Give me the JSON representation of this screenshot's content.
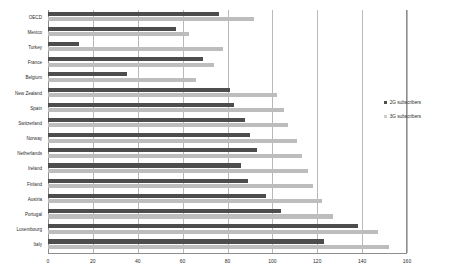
{
  "chart_data": {
    "type": "bar",
    "orientation": "horizontal",
    "title": "",
    "xlabel": "",
    "ylabel": "",
    "xlim": [
      0,
      160
    ],
    "xticks": [
      0,
      20,
      40,
      60,
      80,
      100,
      120,
      140,
      160
    ],
    "grid": true,
    "legend_position": "right",
    "categories": [
      "OECD",
      "Mexico",
      "Turkey",
      "France",
      "Belgium",
      "New Zealand",
      "Spain",
      "Switzerland",
      "Norway",
      "Netherlands",
      "Ireland",
      "Finland",
      "Austria",
      "Portugal",
      "Luxembourg",
      "Italy"
    ],
    "series": [
      {
        "name": "2G subscribers",
        "color": "#4d4d4d",
        "values": [
          76,
          57,
          14,
          69,
          35,
          81,
          83,
          88,
          90,
          93,
          86,
          89,
          97,
          104,
          138,
          123
        ]
      },
      {
        "name": "3G subscribers",
        "color": "#bdbdbd",
        "values": [
          92,
          63,
          78,
          74,
          66,
          102,
          105,
          107,
          111,
          113,
          116,
          118,
          122,
          127,
          147,
          152
        ]
      }
    ]
  },
  "legend": {
    "items": [
      {
        "label": "2G subscribers",
        "swatch": "legend-swatch-2g"
      },
      {
        "label": "3G subscribers",
        "swatch": "legend-swatch-3g"
      }
    ]
  },
  "axis": {
    "tick_labels": [
      "0",
      "20",
      "40",
      "60",
      "80",
      "100",
      "120",
      "140",
      "160"
    ]
  },
  "colors": {
    "series_2g": "#4d4d4d",
    "series_3g": "#bdbdbd",
    "gridline": "#b9b9b9",
    "axis": "#8d8d8d",
    "text": "#2b2b2b",
    "background": "#ffffff"
  }
}
